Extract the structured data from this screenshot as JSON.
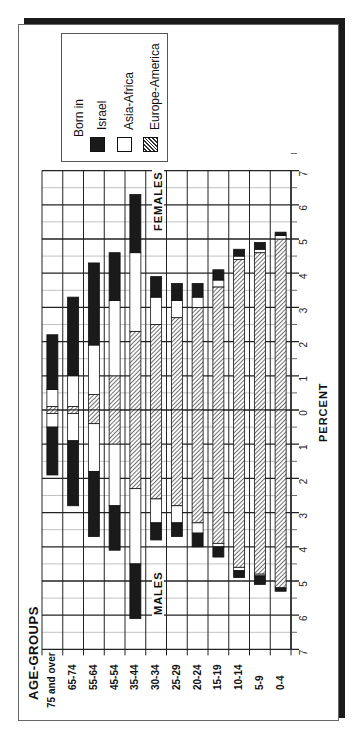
{
  "title": "AGE-GROUPS",
  "legend": {
    "heading": "Born in",
    "items": [
      {
        "label": "Israel",
        "fill": "#1a1a1a"
      },
      {
        "label": "Asia-Africa",
        "fill": "#ffffff"
      },
      {
        "label": "Europe-America",
        "fill": "hatch"
      }
    ]
  },
  "labels": {
    "females": "FEMALES",
    "males": "MALES",
    "xaxis": "PERCENT"
  },
  "chart_data": {
    "type": "bar",
    "title": "AGE-GROUPS",
    "subtype": "population pyramid (rotated, stacked)",
    "categories": [
      "75 and over",
      "65-74",
      "55-64",
      "45-54",
      "35-44",
      "30-34",
      "25-29",
      "20-24",
      "15-19",
      "10-14",
      "5-9",
      "0-4"
    ],
    "xlabel": "PERCENT",
    "ylabel": "AGE-GROUPS",
    "axis_ticks": [
      7,
      6,
      5,
      4,
      3,
      2,
      1,
      0,
      1,
      2,
      3,
      4,
      5,
      6,
      7
    ],
    "xlim": [
      -7,
      7
    ],
    "grid": true,
    "legend_title": "Born in",
    "legend_position": "top-left",
    "females": {
      "series": [
        {
          "name": "Europe-America",
          "values": [
            0.1,
            0.1,
            0.45,
            1.0,
            2.3,
            2.5,
            2.7,
            3.0,
            3.6,
            4.4,
            4.6,
            5.0
          ]
        },
        {
          "name": "Asia-Africa",
          "values": [
            0.5,
            0.9,
            1.45,
            2.2,
            2.3,
            0.8,
            0.5,
            0.3,
            0.2,
            0.1,
            0.1,
            0.1
          ]
        },
        {
          "name": "Israel",
          "values": [
            1.6,
            2.3,
            2.4,
            1.4,
            1.7,
            0.6,
            0.5,
            0.4,
            0.3,
            0.2,
            0.2,
            0.1
          ]
        }
      ],
      "totals": [
        2.2,
        3.3,
        4.3,
        4.6,
        6.3,
        3.9,
        3.7,
        3.7,
        4.1,
        4.7,
        4.9,
        5.2
      ]
    },
    "males": {
      "series": [
        {
          "name": "Europe-America",
          "values": [
            0.1,
            0.1,
            0.4,
            1.0,
            2.3,
            2.6,
            2.8,
            3.3,
            3.9,
            4.6,
            4.8,
            5.2
          ]
        },
        {
          "name": "Asia-Africa",
          "values": [
            0.4,
            0.8,
            1.4,
            1.8,
            2.2,
            0.7,
            0.5,
            0.3,
            0.1,
            0.1,
            0.05,
            0.0
          ]
        },
        {
          "name": "Israel",
          "values": [
            1.4,
            1.9,
            1.9,
            1.3,
            1.6,
            0.5,
            0.4,
            0.4,
            0.3,
            0.2,
            0.25,
            0.1
          ]
        }
      ],
      "totals": [
        1.9,
        2.8,
        3.7,
        4.1,
        6.1,
        3.8,
        3.7,
        4.0,
        4.3,
        4.9,
        5.1,
        5.3
      ]
    }
  }
}
